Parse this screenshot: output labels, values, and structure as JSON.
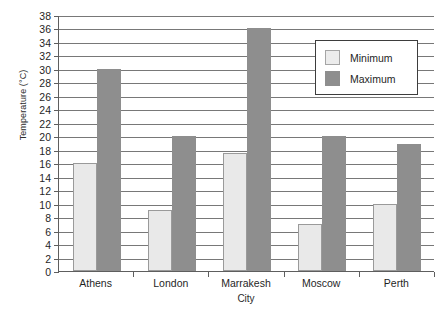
{
  "chart_data": {
    "type": "bar",
    "title": "",
    "xlabel": "City",
    "ylabel": "Temperature (°C)",
    "categories": [
      "Athens",
      "London",
      "Marrakesh",
      "Moscow",
      "Perth"
    ],
    "series": [
      {
        "name": "Minimum",
        "color": "#e9e9e9",
        "values": [
          16,
          9,
          17.5,
          7,
          10
        ]
      },
      {
        "name": "Maximum",
        "color": "#8e8e8e",
        "values": [
          30,
          20,
          36,
          20,
          18.8
        ]
      }
    ],
    "ylim": [
      0,
      38
    ],
    "ytick_step": 2,
    "yticks": [
      0,
      2,
      4,
      6,
      8,
      10,
      12,
      14,
      16,
      18,
      20,
      22,
      24,
      26,
      28,
      30,
      32,
      34,
      36,
      38
    ],
    "ytick_labels": [
      "0",
      "2",
      "4",
      "6",
      "8",
      "10",
      "12",
      "14",
      "16",
      "18",
      "20",
      "22",
      "24",
      "26",
      "28",
      "30",
      "32",
      "34",
      "36",
      "38"
    ],
    "grid": true,
    "grid_axis": "y",
    "legend_position": "top-right",
    "legend_entries": [
      "Minimum",
      "Maximum"
    ]
  },
  "axes": {
    "y_title": "Temperature (°C)",
    "x_title": "City"
  },
  "legend": {
    "items": [
      {
        "label": "Minimum"
      },
      {
        "label": "Maximum"
      }
    ]
  }
}
